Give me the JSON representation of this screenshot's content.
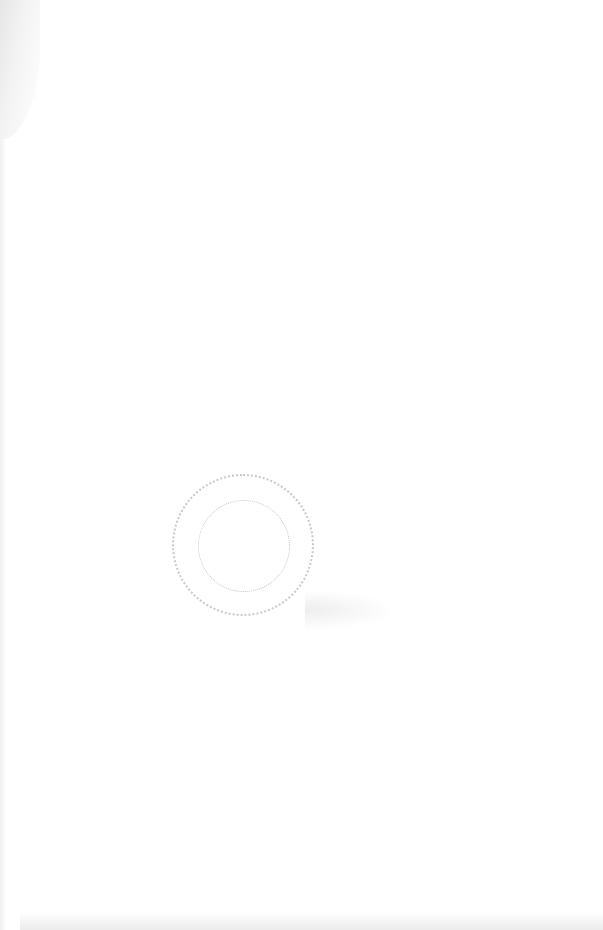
{
  "page": {
    "type": "scanned-page",
    "content": "blank"
  },
  "stamp": {
    "shape": "circular",
    "text_top": "",
    "text_bottom": "",
    "color": "#c8c8c8"
  }
}
